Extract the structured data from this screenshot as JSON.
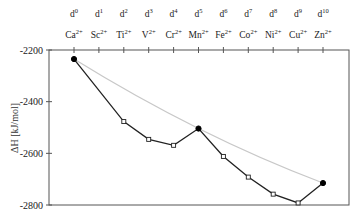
{
  "chart_data": {
    "type": "line",
    "title": "",
    "xlabel": "",
    "ylabel": "ΔH [kJ/mol]",
    "ylim": [
      -2800,
      -2200
    ],
    "yticks": [
      -2200,
      -2400,
      -2600,
      -2800
    ],
    "ytick_labels": [
      "-2200",
      "-2400",
      "-2600",
      "-2800"
    ],
    "grid": false,
    "legend": "none",
    "categories": [
      {
        "config": "d",
        "config_sup": "0",
        "ion": "Ca",
        "charge": "2+"
      },
      {
        "config": "d",
        "config_sup": "1",
        "ion": "Sc",
        "charge": "2+"
      },
      {
        "config": "d",
        "config_sup": "2",
        "ion": "Ti",
        "charge": "2+"
      },
      {
        "config": "d",
        "config_sup": "3",
        "ion": "V",
        "charge": "2+"
      },
      {
        "config": "d",
        "config_sup": "4",
        "ion": "Cr",
        "charge": "2+"
      },
      {
        "config": "d",
        "config_sup": "5",
        "ion": "Mn",
        "charge": "2+"
      },
      {
        "config": "d",
        "config_sup": "6",
        "ion": "Fe",
        "charge": "2+"
      },
      {
        "config": "d",
        "config_sup": "7",
        "ion": "Co",
        "charge": "2+"
      },
      {
        "config": "d",
        "config_sup": "8",
        "ion": "Ni",
        "charge": "2+"
      },
      {
        "config": "d",
        "config_sup": "9",
        "ion": "Cu",
        "charge": "2+"
      },
      {
        "config": "d",
        "config_sup": "10",
        "ion": "Zn",
        "charge": "2+"
      }
    ],
    "series": [
      {
        "name": "experimental hydration enthalpy",
        "color": "#222222",
        "values": [
          -2235,
          null,
          -2477,
          -2546,
          -2569,
          -2504,
          -2612,
          -2692,
          -2758,
          -2792,
          -2715
        ],
        "filled_markers": [
          0,
          5,
          10
        ]
      },
      {
        "name": "baseline (d0-d5-d10 curve)",
        "color": "#c8c8c8",
        "values": [
          -2235,
          null,
          null,
          null,
          null,
          -2504,
          null,
          null,
          null,
          null,
          -2715
        ],
        "smooth": true
      }
    ]
  }
}
